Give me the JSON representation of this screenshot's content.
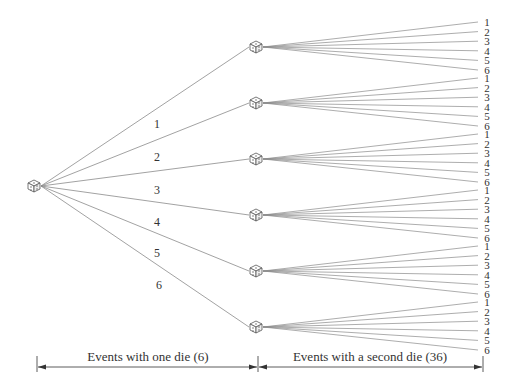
{
  "diagram": {
    "type": "tree",
    "root": {
      "label": "die",
      "icon": "die-icon"
    },
    "first_level_branches": [
      "1",
      "2",
      "3",
      "4",
      "5",
      "6"
    ],
    "second_level_branches": [
      "1",
      "2",
      "3",
      "4",
      "5",
      "6"
    ],
    "colors": {
      "line": "#8a8a8a",
      "text": "#333333",
      "die": "#555555"
    }
  },
  "axis": {
    "left_label": "Events with one die (6)",
    "right_label": "Events with a second die (36)"
  }
}
